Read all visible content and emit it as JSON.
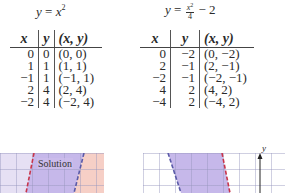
{
  "left_table": {
    "title_lhs": "y",
    "title_eq": " = ",
    "title_var": "x",
    "title_exp": "2",
    "headers": [
      "x",
      "y",
      "(x, y)"
    ],
    "rows": [
      {
        "x": "0",
        "y": "0",
        "pt": "(0, 0)"
      },
      {
        "x": "1",
        "y": "1",
        "pt": "(1, 1)"
      },
      {
        "x": "−1",
        "y": "1",
        "pt": "(−1, 1)"
      },
      {
        "x": "2",
        "y": "4",
        "pt": "(2, 4)"
      },
      {
        "x": "−2",
        "y": "4",
        "pt": "(−2, 4)"
      }
    ]
  },
  "right_table": {
    "title_lhs": "y",
    "title_eq": " = ",
    "title_num_var": "x",
    "title_num_exp": "2",
    "title_den": "4",
    "title_tail": " − 2",
    "headers": [
      "x",
      "y",
      "(x, y)"
    ],
    "rows": [
      {
        "x": "0",
        "y": "−2",
        "pt": "(0, −2)"
      },
      {
        "x": "2",
        "y": "−1",
        "pt": "(2, −1)"
      },
      {
        "x": "−2",
        "y": "−1",
        "pt": "(−2, −1)"
      },
      {
        "x": "4",
        "y": "2",
        "pt": "(4, 2)"
      },
      {
        "x": "−4",
        "y": "2",
        "pt": "(−4, 2)"
      }
    ]
  },
  "left_graph": {
    "region_label": "Solution",
    "colors": {
      "left_region": "#e6e0f4",
      "solution": "#c6b8ea",
      "right_region": "#f6cfc6",
      "red_dash": "#c8344a",
      "blue_dash": "#5a5aa8"
    }
  },
  "right_graph": {
    "axis_label": "y",
    "colors": {
      "shade": "#c6b8ea",
      "red_dash": "#c8344a",
      "blue_dash": "#5a5aa8",
      "axis": "#222222"
    }
  }
}
